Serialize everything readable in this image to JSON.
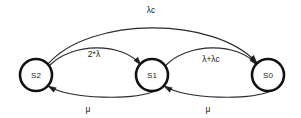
{
  "diagram": {
    "type": "state-transition-diagram",
    "title": "",
    "background_color": "#ffffff",
    "node_stroke_color": "#111111",
    "edge_color": "#2b2b2b",
    "label_color": "#1a1a1a",
    "states": [
      {
        "id": "S2",
        "label": "S2",
        "cx": 36,
        "cy": 75,
        "r": 16
      },
      {
        "id": "S1",
        "label": "S1",
        "cx": 152,
        "cy": 75,
        "r": 16
      },
      {
        "id": "S0",
        "label": "S0",
        "cx": 268,
        "cy": 75,
        "r": 16
      }
    ],
    "transitions": [
      {
        "id": "s2-to-s0",
        "from": "S2",
        "to": "S0",
        "label": "λc",
        "label_x": 151,
        "label_y": 13,
        "path": "M 48 64 C 90 16, 215 16, 257 63",
        "arrow_x": 257,
        "arrow_y": 63,
        "arrow_angle": 48
      },
      {
        "id": "s2-to-s1",
        "from": "S2",
        "to": "S1",
        "label": "2*λ",
        "label_x": 94,
        "label_y": 57,
        "path": "M 49 66 C 72 42, 122 42, 141 65",
        "arrow_x": 141,
        "arrow_y": 65,
        "arrow_angle": 50
      },
      {
        "id": "s1-to-s0",
        "from": "S1",
        "to": "S0",
        "label": "λ+λc",
        "label_x": 211,
        "label_y": 62,
        "path": "M 165 66 C 188 42, 238 42, 257 65",
        "arrow_x": 257,
        "arrow_y": 65,
        "arrow_angle": 50
      },
      {
        "id": "s1-to-s2",
        "from": "S1",
        "to": "S2",
        "label": "μ",
        "label_x": 88,
        "label_y": 112,
        "path": "M 155 91 C 134 100, 72 100, 48 86",
        "arrow_x": 48,
        "arrow_y": 86,
        "arrow_angle": 210
      },
      {
        "id": "s0-to-s1",
        "from": "S0",
        "to": "S1",
        "label": "μ",
        "label_x": 208,
        "label_y": 112,
        "path": "M 271 91 C 250 100, 188 100, 164 86",
        "arrow_x": 164,
        "arrow_y": 86,
        "arrow_angle": 210
      }
    ]
  }
}
